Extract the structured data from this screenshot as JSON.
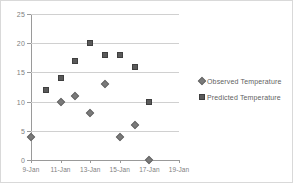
{
  "chart_data": {
    "type": "scatter",
    "title": "",
    "xlabel": "",
    "ylabel": "",
    "ylim": [
      0,
      25
    ],
    "yticks": [
      0,
      5,
      10,
      15,
      20,
      25
    ],
    "ytick_labels": [
      "0",
      "5",
      "10",
      "15",
      "20",
      "25"
    ],
    "xlim": [
      9,
      19
    ],
    "xticks": [
      9,
      11,
      13,
      15,
      17,
      19
    ],
    "xtick_labels": [
      "9-Jan",
      "11-Jan",
      "13-Jan",
      "15-Jan",
      "17-Jan",
      "19-Jan"
    ],
    "grid": "horizontal",
    "legend_position": "right",
    "series": [
      {
        "name": "Observed Temperature",
        "marker": "diamond",
        "color": "#7a7a7a",
        "x": [
          9,
          11,
          12,
          13,
          14,
          15,
          16,
          17
        ],
        "values": [
          4,
          10,
          11,
          8,
          13,
          4,
          6,
          0
        ]
      },
      {
        "name": "Predicted Temperature",
        "marker": "square",
        "color": "#5a5a5a",
        "x": [
          10,
          11,
          12,
          13,
          14,
          15,
          16,
          17
        ],
        "values": [
          12,
          14,
          17,
          20,
          18,
          18,
          16,
          10
        ]
      }
    ]
  },
  "legend": {
    "items": [
      {
        "label": "Observed Temperature",
        "marker": "diamond-icon"
      },
      {
        "label": "Predicted Temperature",
        "marker": "square-icon"
      }
    ]
  }
}
